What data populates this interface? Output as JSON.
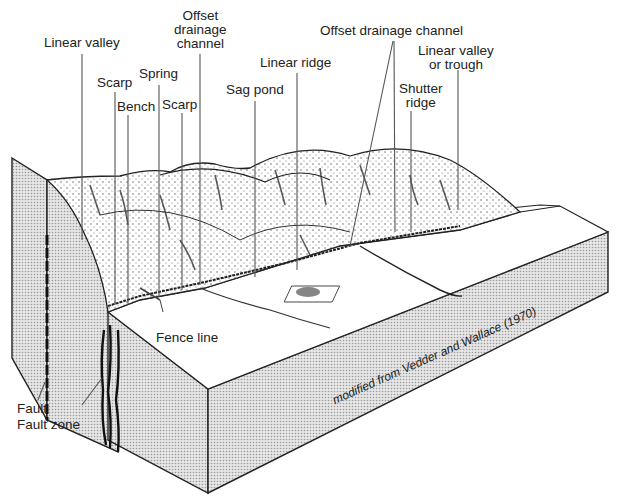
{
  "figure": {
    "credit": "modified from Vedder and Wallace (1970)"
  },
  "labels": {
    "linear_valley": "Linear valley",
    "scarp_1": "Scarp",
    "bench": "Bench",
    "spring": "Spring",
    "scarp_2": "Scarp",
    "offset_drainage_1": [
      "Offset",
      "drainage",
      "channel"
    ],
    "sag_pond": "Sag pond",
    "linear_ridge": "Linear ridge",
    "offset_drainage_2": "Offset drainage channel",
    "shutter_ridge": [
      "Shutter",
      "ridge"
    ],
    "linear_valley_trough": [
      "Linear valley",
      "or trough"
    ],
    "fence_line": "Fence line",
    "fault": "Fault",
    "fault_zone": "Fault zone"
  },
  "colors": {
    "ink": "#222222",
    "side_fill": "#d4d4d4",
    "surface_fill": "#ffffff",
    "hill_shade": "#444444"
  }
}
